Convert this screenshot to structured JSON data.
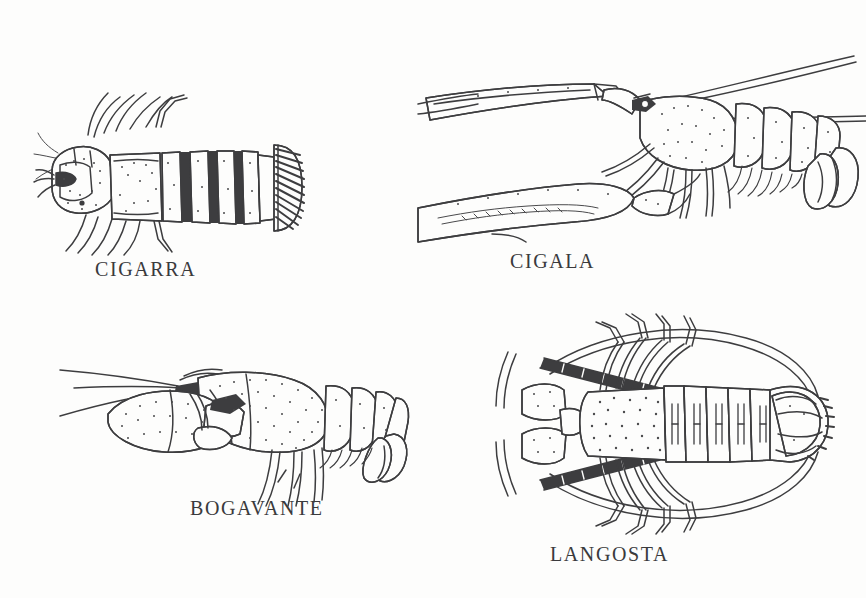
{
  "page": {
    "background_color": "#fdfdfc",
    "ink_color": "#3d3d3f",
    "text_color": "#3a3a3c",
    "layout": "2x2 grid of pen-and-ink crustacean drawings with captions",
    "width": 866,
    "height": 598
  },
  "figures": [
    {
      "id": "cigarra",
      "caption": "CIGARRA",
      "common_name_en": "slipper lobster",
      "view": "dorsal",
      "position": "top-left",
      "caption_x": 95,
      "caption_y": 258
    },
    {
      "id": "cigala",
      "caption": "CIGALA",
      "common_name_en": "Norway lobster / langoustine",
      "view": "lateral",
      "position": "top-right",
      "caption_x": 510,
      "caption_y": 250
    },
    {
      "id": "bogavante",
      "caption": "BOGAVANTE",
      "common_name_en": "European lobster",
      "view": "lateral",
      "position": "bottom-left",
      "caption_x": 190,
      "caption_y": 497
    },
    {
      "id": "langosta",
      "caption": "LANGOSTA",
      "common_name_en": "spiny lobster",
      "view": "dorsal",
      "position": "bottom-right",
      "caption_x": 550,
      "caption_y": 543
    }
  ]
}
